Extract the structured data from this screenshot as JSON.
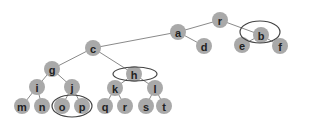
{
  "diagram": {
    "type": "tree",
    "node_radius": 8,
    "colors": {
      "node": "#a9a9a9",
      "edge": "#8a8a8a",
      "label": "#222222",
      "highlight": "#444444"
    },
    "nodes": [
      {
        "id": "r",
        "label": "r",
        "x": 220,
        "y": 20
      },
      {
        "id": "a",
        "label": "a",
        "x": 178,
        "y": 32
      },
      {
        "id": "b",
        "label": "b",
        "x": 261,
        "y": 35
      },
      {
        "id": "e",
        "label": "e",
        "x": 242,
        "y": 45
      },
      {
        "id": "f",
        "label": "f",
        "x": 280,
        "y": 46
      },
      {
        "id": "d",
        "label": "d",
        "x": 204,
        "y": 46
      },
      {
        "id": "c",
        "label": "c",
        "x": 93,
        "y": 48
      },
      {
        "id": "g",
        "label": "g",
        "x": 52,
        "y": 69
      },
      {
        "id": "h",
        "label": "h",
        "x": 134,
        "y": 74
      },
      {
        "id": "i",
        "label": "i",
        "x": 37,
        "y": 87
      },
      {
        "id": "j",
        "label": "j",
        "x": 72,
        "y": 87
      },
      {
        "id": "k",
        "label": "k",
        "x": 115,
        "y": 88
      },
      {
        "id": "l",
        "label": "l",
        "x": 155,
        "y": 88
      },
      {
        "id": "m",
        "label": "m",
        "x": 22,
        "y": 106
      },
      {
        "id": "n",
        "label": "n",
        "x": 42,
        "y": 106
      },
      {
        "id": "o",
        "label": "o",
        "x": 62,
        "y": 106
      },
      {
        "id": "p",
        "label": "p",
        "x": 82,
        "y": 106
      },
      {
        "id": "q",
        "label": "q",
        "x": 105,
        "y": 106
      },
      {
        "id": "r2",
        "label": "r",
        "x": 125,
        "y": 106
      },
      {
        "id": "s",
        "label": "s",
        "x": 146,
        "y": 106
      },
      {
        "id": "t",
        "label": "t",
        "x": 164,
        "y": 106
      }
    ],
    "edges": [
      [
        "r",
        "a"
      ],
      [
        "r",
        "b"
      ],
      [
        "b",
        "e"
      ],
      [
        "b",
        "f"
      ],
      [
        "a",
        "d"
      ],
      [
        "a",
        "c"
      ],
      [
        "c",
        "g"
      ],
      [
        "c",
        "h"
      ],
      [
        "g",
        "i"
      ],
      [
        "g",
        "j"
      ],
      [
        "i",
        "m"
      ],
      [
        "i",
        "n"
      ],
      [
        "j",
        "o"
      ],
      [
        "j",
        "p"
      ],
      [
        "h",
        "k"
      ],
      [
        "h",
        "l"
      ],
      [
        "k",
        "q"
      ],
      [
        "k",
        "r2"
      ],
      [
        "l",
        "s"
      ],
      [
        "l",
        "t"
      ]
    ],
    "highlights": [
      {
        "name": "highlight-b",
        "cx": 260,
        "cy": 32,
        "rx": 20,
        "ry": 11
      },
      {
        "name": "highlight-h",
        "cx": 135,
        "cy": 74,
        "rx": 22,
        "ry": 7
      },
      {
        "name": "highlight-o-p",
        "cx": 72,
        "cy": 106,
        "rx": 20,
        "ry": 11
      }
    ]
  }
}
